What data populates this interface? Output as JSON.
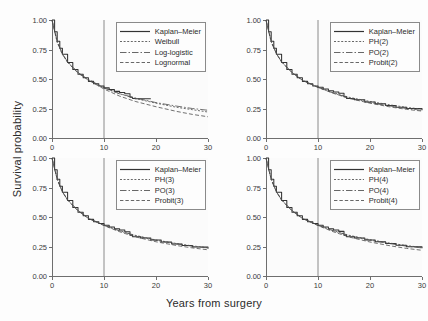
{
  "figure": {
    "xlabel": "Years from surgery",
    "ylabel": "Survival probability",
    "background": "#fdfdfd",
    "line_color": "#4d4d4d",
    "km_color": "#333333",
    "axis_color": "#6e6e6e",
    "reference_line_x": 10
  },
  "chart_data": [
    {
      "type": "line",
      "panel": "top-left",
      "title": "",
      "xlabel": "Years from surgery",
      "ylabel": "Survival probability",
      "xlim": [
        0,
        30
      ],
      "ylim": [
        0.0,
        1.0
      ],
      "xticks": [
        0,
        10,
        20,
        30
      ],
      "yticks": [
        0.0,
        0.25,
        0.5,
        0.75,
        1.0
      ],
      "xticklabels": [
        "0",
        "10",
        "20",
        "30"
      ],
      "yticklabels": [
        "0.00",
        "0.25",
        "0.50",
        "0.75",
        "1.00"
      ],
      "grid": false,
      "legend_position": "upper right",
      "annotations": [
        "vertical reference line at x = 10"
      ],
      "series": [
        {
          "name": "Kaplan-Meier",
          "style": "solid",
          "x": [
            0,
            0.5,
            1,
            1.5,
            2,
            3,
            4,
            5,
            6,
            7,
            8,
            9,
            10,
            11,
            12,
            13,
            14,
            15,
            15.5,
            16,
            17,
            18,
            19
          ],
          "values": [
            1.0,
            0.9,
            0.82,
            0.76,
            0.71,
            0.64,
            0.58,
            0.54,
            0.51,
            0.48,
            0.46,
            0.44,
            0.425,
            0.41,
            0.395,
            0.385,
            0.375,
            0.345,
            0.335,
            0.333,
            0.333,
            0.333,
            0.333
          ]
        },
        {
          "name": "Weibull",
          "style": "dotted",
          "x": [
            0,
            1,
            2,
            3,
            5,
            7,
            10,
            13,
            16,
            20,
            24,
            27,
            30
          ],
          "values": [
            1.0,
            0.81,
            0.71,
            0.645,
            0.555,
            0.495,
            0.425,
            0.375,
            0.335,
            0.295,
            0.26,
            0.24,
            0.22
          ]
        },
        {
          "name": "Log-logistic",
          "style": "dashdot",
          "x": [
            0,
            1,
            2,
            3,
            5,
            7,
            10,
            13,
            16,
            20,
            24,
            27,
            30
          ],
          "values": [
            1.0,
            0.82,
            0.715,
            0.645,
            0.555,
            0.495,
            0.425,
            0.375,
            0.34,
            0.3,
            0.27,
            0.25,
            0.235
          ]
        },
        {
          "name": "Lognormal",
          "style": "dashed",
          "x": [
            0,
            1,
            2,
            3,
            5,
            7,
            10,
            13,
            16,
            20,
            24,
            27,
            30
          ],
          "values": [
            1.0,
            0.815,
            0.71,
            0.64,
            0.55,
            0.49,
            0.415,
            0.355,
            0.31,
            0.265,
            0.225,
            0.2,
            0.18
          ]
        }
      ]
    },
    {
      "type": "line",
      "panel": "top-right",
      "title": "",
      "xlabel": "Years from surgery",
      "ylabel": "Survival probability",
      "xlim": [
        0,
        30
      ],
      "ylim": [
        0.0,
        1.0
      ],
      "xticks": [
        0,
        10,
        20,
        30
      ],
      "yticks": [
        0.0,
        0.25,
        0.5,
        0.75,
        1.0
      ],
      "xticklabels": [
        "0",
        "10",
        "20",
        "30"
      ],
      "yticklabels": [
        "0.00",
        "0.25",
        "0.50",
        "0.75",
        "1.00"
      ],
      "grid": false,
      "legend_position": "upper right",
      "annotations": [
        "vertical reference line at x = 10"
      ],
      "series": [
        {
          "name": "Kaplan-Meier",
          "style": "solid",
          "x": [
            0,
            0.5,
            1,
            1.5,
            2,
            3,
            4,
            5,
            6,
            7,
            8,
            9,
            10,
            11,
            12,
            13,
            14,
            15,
            15.5,
            17,
            19,
            21,
            23,
            25,
            27,
            30
          ],
          "values": [
            1.0,
            0.9,
            0.82,
            0.76,
            0.71,
            0.64,
            0.58,
            0.54,
            0.51,
            0.48,
            0.46,
            0.44,
            0.43,
            0.415,
            0.4,
            0.39,
            0.38,
            0.35,
            0.335,
            0.325,
            0.305,
            0.29,
            0.275,
            0.26,
            0.25,
            0.235
          ]
        },
        {
          "name": "PH(2)",
          "style": "dotted",
          "x": [
            0,
            1,
            2,
            3,
            5,
            7,
            10,
            13,
            16,
            20,
            24,
            27,
            30
          ],
          "values": [
            1.0,
            0.815,
            0.715,
            0.645,
            0.555,
            0.49,
            0.43,
            0.385,
            0.345,
            0.31,
            0.28,
            0.26,
            0.245
          ]
        },
        {
          "name": "PO(2)",
          "style": "dashdot",
          "x": [
            0,
            1,
            2,
            3,
            5,
            7,
            10,
            13,
            16,
            20,
            24,
            27,
            30
          ],
          "values": [
            1.0,
            0.82,
            0.715,
            0.645,
            0.555,
            0.49,
            0.43,
            0.38,
            0.34,
            0.3,
            0.27,
            0.25,
            0.235
          ]
        },
        {
          "name": "Probit(2)",
          "style": "dashed",
          "x": [
            0,
            1,
            2,
            3,
            5,
            7,
            10,
            13,
            16,
            20,
            24,
            27,
            30
          ],
          "values": [
            1.0,
            0.815,
            0.715,
            0.645,
            0.555,
            0.49,
            0.428,
            0.378,
            0.335,
            0.295,
            0.262,
            0.243,
            0.228
          ]
        }
      ]
    },
    {
      "type": "line",
      "panel": "bottom-left",
      "title": "",
      "xlabel": "Years from surgery",
      "ylabel": "Survival probability",
      "xlim": [
        0,
        30
      ],
      "ylim": [
        0.0,
        1.0
      ],
      "xticks": [
        0,
        10,
        20,
        30
      ],
      "yticks": [
        0.0,
        0.25,
        0.5,
        0.75,
        1.0
      ],
      "xticklabels": [
        "0",
        "10",
        "20",
        "30"
      ],
      "yticklabels": [
        "0.00",
        "0.25",
        "0.50",
        "0.75",
        "1.00"
      ],
      "grid": false,
      "legend_position": "upper right",
      "annotations": [
        "vertical reference line at x = 10"
      ],
      "series": [
        {
          "name": "Kaplan-Meier",
          "style": "solid",
          "x": [
            0,
            0.5,
            1,
            1.5,
            2,
            3,
            4,
            5,
            6,
            7,
            8,
            9,
            10,
            11,
            12,
            13,
            14,
            15,
            15.5,
            17,
            19,
            21,
            23,
            25,
            27,
            30
          ],
          "values": [
            1.0,
            0.9,
            0.82,
            0.76,
            0.71,
            0.64,
            0.58,
            0.54,
            0.51,
            0.48,
            0.46,
            0.445,
            0.43,
            0.415,
            0.4,
            0.39,
            0.375,
            0.345,
            0.332,
            0.322,
            0.305,
            0.288,
            0.272,
            0.258,
            0.245,
            0.23
          ]
        },
        {
          "name": "PH(3)",
          "style": "dotted",
          "x": [
            0,
            1,
            2,
            3,
            5,
            7,
            10,
            13,
            16,
            20,
            24,
            27,
            30
          ],
          "values": [
            1.0,
            0.82,
            0.715,
            0.645,
            0.555,
            0.49,
            0.43,
            0.385,
            0.345,
            0.305,
            0.275,
            0.255,
            0.24
          ]
        },
        {
          "name": "PO(3)",
          "style": "dashdot",
          "x": [
            0,
            1,
            2,
            3,
            5,
            7,
            10,
            13,
            16,
            20,
            24,
            27,
            30
          ],
          "values": [
            1.0,
            0.82,
            0.715,
            0.645,
            0.555,
            0.49,
            0.43,
            0.382,
            0.342,
            0.302,
            0.272,
            0.252,
            0.238
          ]
        },
        {
          "name": "Probit(3)",
          "style": "dashed",
          "x": [
            0,
            1,
            2,
            3,
            5,
            7,
            10,
            13,
            16,
            20,
            24,
            27,
            30
          ],
          "values": [
            1.0,
            0.818,
            0.713,
            0.643,
            0.552,
            0.488,
            0.427,
            0.375,
            0.332,
            0.29,
            0.258,
            0.238,
            0.222
          ]
        }
      ]
    },
    {
      "type": "line",
      "panel": "bottom-right",
      "title": "",
      "xlabel": "Years from surgery",
      "ylabel": "Survival probability",
      "xlim": [
        0,
        30
      ],
      "ylim": [
        0.0,
        1.0
      ],
      "xticks": [
        0,
        10,
        20,
        30
      ],
      "yticks": [
        0.0,
        0.25,
        0.5,
        0.75,
        1.0
      ],
      "xticklabels": [
        "0",
        "10",
        "20",
        "30"
      ],
      "yticklabels": [
        "0.00",
        "0.25",
        "0.50",
        "0.75",
        "1.00"
      ],
      "grid": false,
      "legend_position": "upper right",
      "annotations": [
        "vertical reference line at x = 10"
      ],
      "series": [
        {
          "name": "Kaplan-Meier",
          "style": "solid",
          "x": [
            0,
            0.5,
            1,
            1.5,
            2,
            3,
            4,
            5,
            6,
            7,
            8,
            9,
            10,
            11,
            12,
            13,
            14,
            15,
            15.5,
            17,
            19,
            21,
            23,
            25,
            27,
            30
          ],
          "values": [
            1.0,
            0.9,
            0.82,
            0.76,
            0.71,
            0.64,
            0.58,
            0.54,
            0.51,
            0.48,
            0.46,
            0.445,
            0.43,
            0.415,
            0.4,
            0.39,
            0.378,
            0.345,
            0.333,
            0.322,
            0.305,
            0.29,
            0.275,
            0.26,
            0.248,
            0.235
          ]
        },
        {
          "name": "PH(4)",
          "style": "dotted",
          "x": [
            0,
            1,
            2,
            3,
            5,
            7,
            10,
            13,
            16,
            20,
            24,
            27,
            30
          ],
          "values": [
            1.0,
            0.82,
            0.715,
            0.645,
            0.555,
            0.49,
            0.43,
            0.385,
            0.345,
            0.308,
            0.278,
            0.258,
            0.242
          ]
        },
        {
          "name": "PO(4)",
          "style": "dashdot",
          "x": [
            0,
            1,
            2,
            3,
            5,
            7,
            10,
            13,
            16,
            20,
            24,
            27,
            30
          ],
          "values": [
            1.0,
            0.82,
            0.715,
            0.645,
            0.555,
            0.49,
            0.43,
            0.382,
            0.342,
            0.303,
            0.273,
            0.253,
            0.238
          ]
        },
        {
          "name": "Probit(4)",
          "style": "dashed",
          "x": [
            0,
            1,
            2,
            3,
            5,
            7,
            10,
            13,
            16,
            20,
            24,
            27,
            30
          ],
          "values": [
            1.0,
            0.818,
            0.713,
            0.643,
            0.552,
            0.488,
            0.427,
            0.374,
            0.33,
            0.288,
            0.255,
            0.234,
            0.218
          ]
        }
      ]
    }
  ]
}
